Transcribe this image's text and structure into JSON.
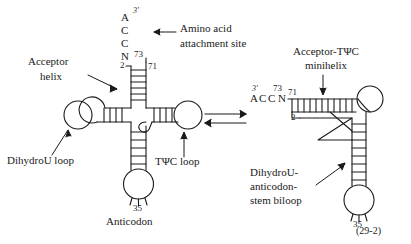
{
  "figure": {
    "reference": "(29-2)",
    "background_color": "#ffffff",
    "stroke_color": "#1a1a1a"
  },
  "left_structure": {
    "name": "cloverleaf-trna",
    "acceptor_end_sequence": [
      "A",
      "C",
      "C",
      "N"
    ],
    "three_prime_label": "3'",
    "residue_73": "73",
    "residue_71": "71",
    "residue_2": "2",
    "anticodon_residue": "35",
    "labels": {
      "amino_acid_site_line1": "Amino acid",
      "amino_acid_site_line2": "attachment site",
      "acceptor_helix_line1": "Acceptor",
      "acceptor_helix_line2": "helix",
      "dihydrou_loop": "DihydroU loop",
      "tpsic_loop": "TΨC loop",
      "anticodon": "Anticodon"
    }
  },
  "equilibrium": {
    "name": "equilibrium-arrows",
    "forward": "→",
    "reverse": "←"
  },
  "right_structure": {
    "name": "minihelix-biloop-trna",
    "acceptor_end_sequence": [
      "A",
      "C",
      "C",
      "N"
    ],
    "three_prime_label": "3'",
    "residue_73": "73",
    "residue_71": "71",
    "residue_2": "2",
    "anticodon_residue": "35",
    "labels": {
      "minihelix_line1": "Acceptor-TΨC",
      "minihelix_line2": "minihelix",
      "biloop_line1": "DihydroU-",
      "biloop_line2": "anticodon-",
      "biloop_line3": "stem biloop"
    }
  }
}
